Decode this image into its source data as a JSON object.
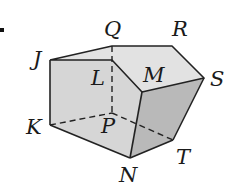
{
  "figure": {
    "title": "",
    "marker_dot": ".",
    "vertices": {
      "J": {
        "label": "J",
        "x": 50,
        "y": 60
      },
      "Q": {
        "label": "Q",
        "x": 112,
        "y": 46
      },
      "R": {
        "label": "R",
        "x": 172,
        "y": 46
      },
      "S": {
        "label": "S",
        "x": 204,
        "y": 78
      },
      "L": {
        "label": "L",
        "x": 112,
        "y": 60
      },
      "M": {
        "label": "M",
        "x": 142,
        "y": 92
      },
      "K": {
        "label": "K",
        "x": 50,
        "y": 125
      },
      "P": {
        "label": "P",
        "x": 112,
        "y": 113
      },
      "N": {
        "label": "N",
        "x": 130,
        "y": 158
      },
      "T": {
        "label": "T",
        "x": 173,
        "y": 140
      }
    },
    "labels": {
      "J": "J",
      "Q": "Q",
      "R": "R",
      "S": "S",
      "L": "L",
      "M": "M",
      "K": "K",
      "P": "P",
      "N": "N",
      "T": "T"
    },
    "visible_edges": [
      "J-Q",
      "Q-R",
      "R-S",
      "S-M",
      "M-L",
      "L-J",
      "J-K",
      "K-N",
      "N-M",
      "N-T",
      "T-S"
    ],
    "hidden_edges": [
      "Q-L",
      "L-P",
      "K-P",
      "P-T"
    ],
    "colors": {
      "top_face": "#e2e2e2",
      "front_face": "#d6d6d6",
      "right_face": "#b9b9b9",
      "edge": "#222222"
    }
  }
}
